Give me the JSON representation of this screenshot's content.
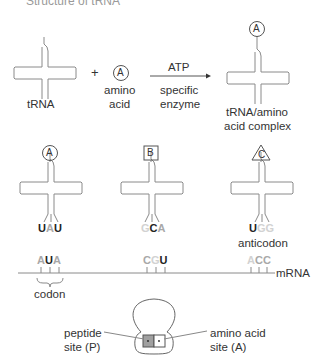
{
  "title": "Structure of tRNA",
  "reaction": {
    "trna_label": "tRNA",
    "plus": "+",
    "amino_acid_symbol": "A",
    "amino_acid_label_line1": "amino",
    "amino_acid_label_line2": "acid",
    "arrow_top": "ATP",
    "arrow_bottom_line1": "specific",
    "arrow_bottom_line2": "enzyme",
    "complex_symbol": "A",
    "complex_label_line1": "tRNA/amino",
    "complex_label_line2": "acid complex"
  },
  "trnas": [
    {
      "symbol": "A",
      "shape": "circle",
      "anticodon": [
        {
          "base": "U",
          "shade": "dark"
        },
        {
          "base": "A",
          "shade": "mid"
        },
        {
          "base": "U",
          "shade": "dark"
        }
      ]
    },
    {
      "symbol": "B",
      "shape": "square",
      "anticodon": [
        {
          "base": "G",
          "shade": "light"
        },
        {
          "base": "C",
          "shade": "dark"
        },
        {
          "base": "A",
          "shade": "mid"
        }
      ]
    },
    {
      "symbol": "C",
      "shape": "triangle",
      "anticodon": [
        {
          "base": "U",
          "shade": "dark"
        },
        {
          "base": "G",
          "shade": "light"
        },
        {
          "base": "G",
          "shade": "light"
        }
      ]
    }
  ],
  "anticodon_label": "anticodon",
  "mrna": {
    "label": "mRNA",
    "codons": [
      [
        {
          "base": "A",
          "shade": "mid"
        },
        {
          "base": "U",
          "shade": "dark"
        },
        {
          "base": "A",
          "shade": "mid"
        }
      ],
      [
        {
          "base": "C",
          "shade": "mid"
        },
        {
          "base": "G",
          "shade": "light"
        },
        {
          "base": "U",
          "shade": "dark"
        }
      ],
      [
        {
          "base": "A",
          "shade": "light"
        },
        {
          "base": "C",
          "shade": "mid"
        },
        {
          "base": "C",
          "shade": "mid"
        }
      ]
    ],
    "codon_label": "codon"
  },
  "ribosome": {
    "p_site_line1": "peptide",
    "p_site_line2": "site (P)",
    "a_site_line1": "amino acid",
    "a_site_line2": "site (A)"
  },
  "colors": {
    "line": "#8a8a8a",
    "dark_base": "#222222",
    "mid_base": "#a8a8a8",
    "light_base": "#d2d2d2",
    "p_site_fill": "#a0a0a0"
  }
}
